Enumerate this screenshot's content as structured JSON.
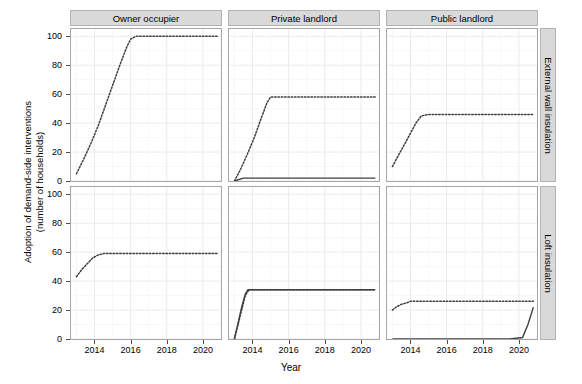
{
  "chart_data": {
    "type": "line",
    "title": "",
    "xlabel": "Year",
    "ylabel": "Adoption of demand-side interventions\n(number of households)",
    "xlim": [
      2012.7,
      2021.0
    ],
    "ylim": [
      0,
      105
    ],
    "xticks": [
      2014,
      2016,
      2018,
      2020
    ],
    "yticks": [
      0,
      20,
      40,
      60,
      80,
      100
    ],
    "grid": true,
    "legend": "none",
    "facet_cols": [
      "Owner occupier",
      "Private landlord",
      "Public landlord"
    ],
    "facet_rows": [
      "External wall insulation",
      "Loft insulation"
    ],
    "panels": [
      {
        "row": "External wall insulation",
        "col": "Owner occupier",
        "series": [
          {
            "name": "modelled",
            "style": "dotted",
            "color": "#3f3f3f",
            "x": [
              2013.0,
              2013.4,
              2013.8,
              2014.2,
              2014.6,
              2015.0,
              2015.4,
              2015.8,
              2016.0,
              2016.3,
              2017.0,
              2018.0,
              2019.0,
              2020.0,
              2020.8
            ],
            "y": [
              5,
              15,
              26,
              38,
              52,
              66,
              80,
              93,
              98,
              100,
              100,
              100,
              100,
              100,
              100
            ]
          }
        ]
      },
      {
        "row": "External wall insulation",
        "col": "Private landlord",
        "series": [
          {
            "name": "modelled",
            "style": "dotted",
            "color": "#3f3f3f",
            "x": [
              2013.0,
              2013.3,
              2013.7,
              2014.1,
              2014.5,
              2014.8,
              2015.0,
              2016.0,
              2017.0,
              2018.0,
              2019.0,
              2020.0,
              2020.8
            ],
            "y": [
              0,
              7,
              18,
              30,
              44,
              54,
              58,
              58,
              58,
              58,
              58,
              58,
              58
            ]
          },
          {
            "name": "observed",
            "style": "solid",
            "color": "#3f3f3f",
            "x": [
              2013.0,
              2013.5,
              2014.0,
              2016.0,
              2018.0,
              2020.0,
              2020.8
            ],
            "y": [
              0,
              2,
              2,
              2,
              2,
              2,
              2
            ]
          }
        ]
      },
      {
        "row": "External wall insulation",
        "col": "Public landlord",
        "series": [
          {
            "name": "modelled",
            "style": "dotted",
            "color": "#3f3f3f",
            "x": [
              2013.0,
              2013.3,
              2013.7,
              2014.0,
              2014.3,
              2014.6,
              2015.0,
              2016.0,
              2017.0,
              2018.0,
              2019.0,
              2020.0,
              2020.8
            ],
            "y": [
              10,
              17,
              26,
              33,
              40,
              45,
              46,
              46,
              46,
              46,
              46,
              46,
              46
            ]
          }
        ]
      },
      {
        "row": "Loft insulation",
        "col": "Owner occupier",
        "series": [
          {
            "name": "modelled",
            "style": "dotted",
            "color": "#3f3f3f",
            "x": [
              2013.0,
              2013.3,
              2013.6,
              2013.9,
              2014.2,
              2014.5,
              2015.0,
              2016.0,
              2017.0,
              2018.0,
              2019.0,
              2020.0,
              2020.8
            ],
            "y": [
              43,
              48,
              52,
              56,
              58,
              59,
              59,
              59,
              59,
              59,
              59,
              59,
              59
            ]
          }
        ]
      },
      {
        "row": "Loft insulation",
        "col": "Private landlord",
        "series": [
          {
            "name": "modelled",
            "style": "dotted",
            "color": "#3f3f3f",
            "x": [
              2013.0,
              2013.2,
              2013.4,
              2013.6,
              2013.8,
              2014.0,
              2015.0,
              2016.0,
              2018.0,
              2020.0,
              2020.8
            ],
            "y": [
              0,
              10,
              20,
              30,
              34,
              34,
              34,
              34,
              34,
              34,
              34
            ]
          },
          {
            "name": "observed",
            "style": "solid",
            "color": "#3f3f3f",
            "x": [
              2013.0,
              2013.2,
              2013.4,
              2013.6,
              2013.75,
              2014.0,
              2016.0,
              2018.0,
              2020.0,
              2020.8
            ],
            "y": [
              0,
              11,
              22,
              31,
              34,
              34,
              34,
              34,
              34,
              34
            ]
          }
        ]
      },
      {
        "row": "Loft insulation",
        "col": "Public landlord",
        "series": [
          {
            "name": "modelled",
            "style": "dotted",
            "color": "#3f3f3f",
            "x": [
              2013.0,
              2013.2,
              2013.5,
              2013.8,
              2014.0,
              2015.0,
              2016.0,
              2017.0,
              2018.0,
              2019.0,
              2020.0,
              2020.8
            ],
            "y": [
              20,
              22,
              24,
              25,
              26,
              26,
              26,
              26,
              26,
              26,
              26,
              26
            ]
          },
          {
            "name": "observed",
            "style": "solid",
            "color": "#3f3f3f",
            "x": [
              2013.0,
              2014.0,
              2016.0,
              2018.0,
              2019.5,
              2020.2,
              2020.5,
              2020.8
            ],
            "y": [
              0,
              0,
              0,
              0,
              0,
              1,
              10,
              22
            ]
          }
        ]
      }
    ]
  },
  "axis": {
    "y_tick_labels": [
      "100",
      "80",
      "60",
      "40",
      "20",
      "0"
    ],
    "x_tick_labels": [
      "2014",
      "2016",
      "2018",
      "2020"
    ],
    "x_title": "Year",
    "y_title_line1": "Adoption of demand-side interventions",
    "y_title_line2": "(number of households)"
  },
  "strips": {
    "top": [
      "Owner occupier",
      "Private landlord",
      "Public landlord"
    ],
    "right": [
      "External wall insulation",
      "Loft insulation"
    ]
  },
  "colors": {
    "strip_fill": "#d9d9d9",
    "strip_border": "#b3b3b3",
    "panel_border": "#a6a6a6",
    "grid": "#ebebeb",
    "line": "#3f3f3f",
    "text": "#000000"
  }
}
